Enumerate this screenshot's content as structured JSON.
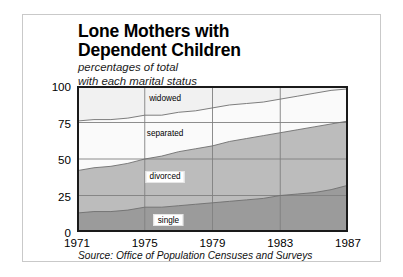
{
  "title": {
    "line1": "Lone Mothers with",
    "line2": "Dependent Children"
  },
  "subtitle": {
    "line1": "percentages of total",
    "line2": "with each marital status"
  },
  "source": "Source: Office of Population Censuses and Surveys",
  "chart_data": {
    "type": "area",
    "stacked": true,
    "title": "Lone Mothers with Dependent Children",
    "subtitle": "percentages of total with each marital status",
    "xlabel": "",
    "ylabel": "",
    "xlim": [
      1971,
      1987
    ],
    "ylim": [
      0,
      100
    ],
    "grid": true,
    "legend_position": "inline",
    "source": "Source: Office of Population Censuses and Surveys",
    "yticks": [
      0,
      25,
      50,
      75,
      100
    ],
    "ytick_labels": [
      "0",
      "25",
      "50",
      "75",
      "100"
    ],
    "xticks": [
      1971,
      1975,
      1979,
      1983,
      1987
    ],
    "xtick_labels": [
      "1971",
      "1975",
      "1979",
      "1983",
      "1987"
    ],
    "x": [
      1971,
      1972,
      1973,
      1974,
      1975,
      1976,
      1977,
      1978,
      1979,
      1980,
      1981,
      1982,
      1983,
      1984,
      1985,
      1986,
      1987
    ],
    "series": [
      {
        "name": "single",
        "label": "single",
        "color": "#9b9b9b",
        "values": [
          13,
          14,
          14,
          15,
          17,
          17,
          18,
          19,
          20,
          21,
          22,
          23,
          25,
          26,
          27,
          29,
          32
        ]
      },
      {
        "name": "divorced",
        "label": "divorced",
        "color": "#bcbcbc",
        "values": [
          29,
          30,
          31,
          32,
          33,
          35,
          37,
          38,
          39,
          41,
          42,
          43,
          43,
          44,
          45,
          45,
          44
        ]
      },
      {
        "name": "separated",
        "label": "separated",
        "color": "#fafafa",
        "values": [
          34,
          33,
          32,
          31,
          30,
          28,
          27,
          26,
          26,
          25,
          24,
          23,
          23,
          23,
          23,
          23,
          22
        ]
      },
      {
        "name": "widowed",
        "label": "widowed",
        "color": "#f1f1f1",
        "values": [
          24,
          23,
          23,
          22,
          21,
          20,
          19,
          18,
          16,
          15,
          14,
          13,
          12,
          11,
          10,
          9,
          2
        ]
      }
    ],
    "cumulative_boundaries": {
      "single_top": [
        13,
        14,
        14,
        15,
        17,
        17,
        18,
        19,
        20,
        21,
        22,
        23,
        25,
        26,
        27,
        29,
        32
      ],
      "divorced_top": [
        42,
        44,
        45,
        47,
        50,
        52,
        55,
        57,
        59,
        62,
        64,
        66,
        68,
        70,
        72,
        74,
        76
      ],
      "separated_top": [
        76,
        77,
        77,
        78,
        80,
        80,
        82,
        83,
        85,
        87,
        88,
        89,
        91,
        93,
        95,
        97,
        98
      ],
      "widowed_top": [
        100,
        100,
        100,
        100,
        100,
        100,
        100,
        100,
        100,
        100,
        100,
        100,
        100,
        100,
        100,
        100,
        100
      ]
    },
    "annotations": [
      {
        "text": "widowed",
        "x": 1976.2,
        "y": 92,
        "boxed": false
      },
      {
        "text": "separated",
        "x": 1976.2,
        "y": 67.5,
        "boxed": false
      },
      {
        "text": "divorced",
        "x": 1976.2,
        "y": 38,
        "boxed": true
      },
      {
        "text": "single",
        "x": 1976.4,
        "y": 8,
        "boxed": true
      }
    ]
  }
}
